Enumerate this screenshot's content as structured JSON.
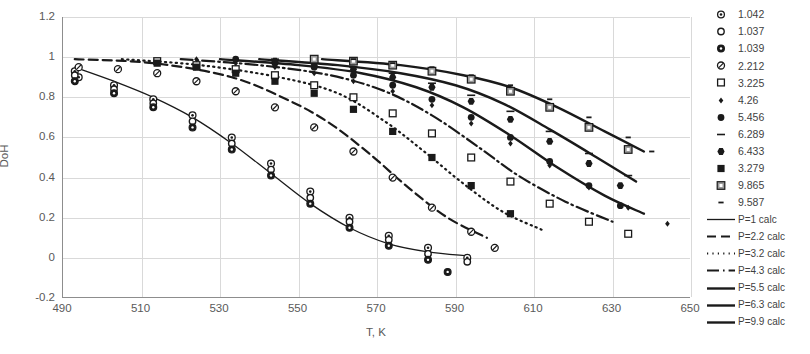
{
  "chart_data": {
    "type": "scatter",
    "title": "",
    "xlabel": "T, K",
    "ylabel": "DoH",
    "xlim": [
      490,
      650
    ],
    "ylim": [
      -0.2,
      1.2
    ],
    "xticks": [
      490,
      510,
      530,
      550,
      570,
      590,
      610,
      630,
      650
    ],
    "yticks": [
      -0.2,
      0,
      0.2,
      0.4,
      0.6,
      0.8,
      1,
      1.2
    ],
    "grid": true,
    "legend_position": "right",
    "colors": {
      "foreground": "#1a1a1a",
      "grid": "#d9d9d9",
      "axis": "#8d8d8d",
      "text": "#595959"
    },
    "series": [
      {
        "name": "1.042",
        "marker": "circle-dot",
        "style": "scatter",
        "x": [
          493,
          494,
          503,
          513,
          523,
          533,
          543,
          553,
          563,
          573,
          583,
          593
        ],
        "y": [
          0.93,
          0.9,
          0.86,
          0.79,
          0.71,
          0.6,
          0.47,
          0.33,
          0.2,
          0.11,
          0.05,
          0.0
        ]
      },
      {
        "name": "1.037",
        "marker": "circle-open",
        "style": "scatter",
        "x": [
          493,
          503,
          513,
          523,
          533,
          543,
          553,
          563,
          573,
          583,
          593
        ],
        "y": [
          0.91,
          0.84,
          0.77,
          0.68,
          0.57,
          0.44,
          0.3,
          0.18,
          0.09,
          0.02,
          -0.02
        ]
      },
      {
        "name": "1.039",
        "marker": "circle-filled-dot",
        "style": "scatter",
        "x": [
          493,
          503,
          513,
          523,
          533,
          543,
          553,
          563,
          573,
          583,
          588
        ],
        "y": [
          0.88,
          0.82,
          0.75,
          0.65,
          0.54,
          0.41,
          0.27,
          0.15,
          0.06,
          -0.01,
          -0.07
        ]
      },
      {
        "name": "2.212",
        "marker": "circle-slash",
        "style": "scatter",
        "x": [
          494,
          504,
          514,
          524,
          534,
          544,
          554,
          564,
          574,
          584,
          594,
          600
        ],
        "y": [
          0.95,
          0.94,
          0.92,
          0.88,
          0.83,
          0.75,
          0.65,
          0.53,
          0.4,
          0.25,
          0.13,
          0.05
        ]
      },
      {
        "name": "3.225",
        "marker": "square-open",
        "style": "scatter",
        "x": [
          514,
          524,
          534,
          544,
          554,
          564,
          574,
          584,
          594,
          604,
          614,
          624,
          634
        ],
        "y": [
          0.98,
          0.96,
          0.94,
          0.91,
          0.86,
          0.8,
          0.72,
          0.62,
          0.5,
          0.38,
          0.27,
          0.18,
          0.12
        ]
      },
      {
        "name": "4.26",
        "marker": "small-diamond",
        "style": "scatter",
        "x": [
          524,
          534,
          544,
          554,
          564,
          574,
          584,
          594,
          604,
          614,
          624,
          634,
          644
        ],
        "y": [
          0.99,
          0.97,
          0.95,
          0.92,
          0.88,
          0.83,
          0.76,
          0.67,
          0.57,
          0.46,
          0.35,
          0.25,
          0.17
        ]
      },
      {
        "name": "5.456",
        "marker": "circle-solid",
        "style": "scatter",
        "x": [
          534,
          544,
          554,
          564,
          574,
          584,
          594,
          604,
          614,
          624,
          632
        ],
        "y": [
          0.99,
          0.97,
          0.95,
          0.91,
          0.86,
          0.79,
          0.7,
          0.6,
          0.48,
          0.36,
          0.26
        ]
      },
      {
        "name": "6.289",
        "marker": "dash",
        "style": "scatter",
        "x": [
          544,
          554,
          564,
          574,
          584,
          594,
          604,
          614,
          624,
          634
        ],
        "y": [
          0.99,
          0.98,
          0.95,
          0.92,
          0.87,
          0.81,
          0.73,
          0.63,
          0.52,
          0.41
        ]
      },
      {
        "name": "6.433",
        "marker": "hex-solid",
        "style": "scatter",
        "x": [
          544,
          554,
          564,
          574,
          584,
          594,
          604,
          614,
          624,
          632
        ],
        "y": [
          0.98,
          0.96,
          0.94,
          0.9,
          0.85,
          0.78,
          0.69,
          0.58,
          0.47,
          0.36
        ]
      },
      {
        "name": "3.279",
        "marker": "square-solid",
        "style": "scatter",
        "x": [
          514,
          524,
          534,
          544,
          554,
          564,
          574,
          584,
          594,
          604
        ],
        "y": [
          0.97,
          0.95,
          0.92,
          0.88,
          0.82,
          0.74,
          0.63,
          0.5,
          0.36,
          0.22
        ]
      },
      {
        "name": "9.865",
        "marker": "square-in-square",
        "style": "scatter",
        "x": [
          554,
          564,
          574,
          584,
          594,
          604,
          614,
          624,
          634
        ],
        "y": [
          0.99,
          0.98,
          0.96,
          0.93,
          0.89,
          0.83,
          0.75,
          0.65,
          0.54
        ]
      },
      {
        "name": "9.587",
        "marker": "tiny-dash",
        "style": "scatter",
        "x": [
          564,
          574,
          584,
          594,
          604,
          614,
          624,
          634,
          640
        ],
        "y": [
          0.99,
          0.97,
          0.95,
          0.91,
          0.86,
          0.79,
          0.7,
          0.6,
          0.53
        ]
      },
      {
        "name": "P=1 calc",
        "style": "line",
        "dash": "solid",
        "x": [
          493,
          503,
          513,
          523,
          533,
          543,
          553,
          563,
          573,
          583,
          593
        ],
        "y": [
          0.95,
          0.88,
          0.8,
          0.7,
          0.57,
          0.42,
          0.27,
          0.15,
          0.07,
          0.03,
          0.01
        ]
      },
      {
        "name": "P=2.2 calc",
        "style": "line",
        "dash": "dashed",
        "x": [
          493,
          513,
          533,
          548,
          558,
          568,
          578,
          588,
          598
        ],
        "y": [
          0.99,
          0.97,
          0.9,
          0.78,
          0.67,
          0.52,
          0.35,
          0.2,
          0.1
        ]
      },
      {
        "name": "P=3.2 calc",
        "style": "line",
        "dash": "dotted",
        "x": [
          505,
          525,
          545,
          560,
          572,
          582,
          592,
          602,
          612
        ],
        "y": [
          0.99,
          0.96,
          0.9,
          0.82,
          0.68,
          0.53,
          0.37,
          0.23,
          0.14
        ]
      },
      {
        "name": "P=4.3 calc",
        "style": "line",
        "dash": "dash-dot",
        "x": [
          520,
          540,
          558,
          572,
          584,
          596,
          606,
          618,
          630
        ],
        "y": [
          0.99,
          0.96,
          0.91,
          0.83,
          0.71,
          0.55,
          0.41,
          0.28,
          0.18
        ]
      },
      {
        "name": "P=5.5 calc",
        "style": "line",
        "dash": "solid-bold",
        "x": [
          530,
          550,
          566,
          580,
          592,
          604,
          616,
          628,
          638
        ],
        "y": [
          0.99,
          0.96,
          0.92,
          0.85,
          0.75,
          0.61,
          0.45,
          0.31,
          0.22
        ]
      },
      {
        "name": "P=6.3 calc",
        "style": "line",
        "dash": "solid-bold",
        "x": [
          540,
          560,
          576,
          590,
          602,
          614,
          626,
          636
        ],
        "y": [
          0.99,
          0.96,
          0.92,
          0.86,
          0.77,
          0.64,
          0.5,
          0.38
        ]
      },
      {
        "name": "P=9.9 calc",
        "style": "line",
        "dash": "solid-bold",
        "x": [
          556,
          576,
          592,
          604,
          616,
          628,
          638
        ],
        "y": [
          0.99,
          0.96,
          0.91,
          0.85,
          0.75,
          0.63,
          0.53
        ]
      }
    ]
  },
  "axes": {
    "ylabel": "DoH",
    "xlabel": "T, K",
    "yticks": [
      "1.2",
      "1",
      "0.8",
      "0.6",
      "0.4",
      "0.2",
      "0",
      "-0.2"
    ],
    "xticks": [
      "490",
      "510",
      "530",
      "550",
      "570",
      "590",
      "610",
      "630",
      "650"
    ]
  },
  "legend": {
    "markers": [
      {
        "label": "1.042",
        "glyph": "circle-dot"
      },
      {
        "label": "1.037",
        "glyph": "circle-open"
      },
      {
        "label": "1.039",
        "glyph": "circle-filled-dot"
      },
      {
        "label": "2.212",
        "glyph": "circle-slash"
      },
      {
        "label": "3.225",
        "glyph": "square-open"
      },
      {
        "label": "4.26",
        "glyph": "small-diamond"
      },
      {
        "label": "5.456",
        "glyph": "circle-solid"
      },
      {
        "label": "6.289",
        "glyph": "dash"
      },
      {
        "label": "6.433",
        "glyph": "hex-solid"
      },
      {
        "label": "3.279",
        "glyph": "square-solid"
      },
      {
        "label": "9.865",
        "glyph": "square-in-square"
      },
      {
        "label": "9.587",
        "glyph": "tiny-dash"
      }
    ],
    "lines": [
      {
        "label": "P=1 calc",
        "dash": "solid"
      },
      {
        "label": "P=2.2 calc",
        "dash": "dashed"
      },
      {
        "label": "P=3.2 calc",
        "dash": "dotted"
      },
      {
        "label": "P=4.3 calc",
        "dash": "dash-dot"
      },
      {
        "label": "P=5.5 calc",
        "dash": "solid-bold"
      },
      {
        "label": "P=6.3 calc",
        "dash": "solid-bold"
      },
      {
        "label": "P=9.9 calc",
        "dash": "solid-bold"
      }
    ]
  }
}
